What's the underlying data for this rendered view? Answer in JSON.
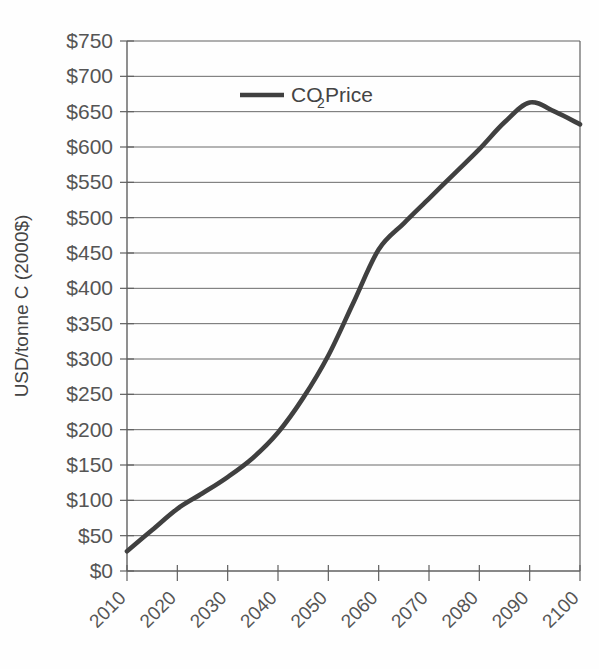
{
  "chart_data": {
    "type": "line",
    "title": "",
    "xlabel": "",
    "ylabel": "USD/tonne C (2000$)",
    "xlim": [
      2010,
      2100
    ],
    "ylim": [
      0,
      750
    ],
    "grid": true,
    "grid_axis": "y",
    "legend_position": "top-center",
    "line_color": "#404040",
    "series": [
      {
        "name": "CO2 Price",
        "label_main": "CO",
        "label_sub": "2",
        "label_tail": " Price",
        "x": [
          2010,
          2015,
          2020,
          2025,
          2030,
          2035,
          2040,
          2045,
          2050,
          2055,
          2060,
          2065,
          2070,
          2075,
          2080,
          2085,
          2090,
          2095,
          2100
        ],
        "values": [
          28,
          58,
          88,
          110,
          133,
          160,
          196,
          245,
          305,
          380,
          455,
          492,
          527,
          562,
          597,
          635,
          663,
          650,
          632
        ]
      }
    ],
    "x_ticks": [
      2010,
      2020,
      2030,
      2040,
      2050,
      2060,
      2070,
      2080,
      2090,
      2100
    ],
    "x_tick_labels": [
      "2010",
      "2020",
      "2030",
      "2040",
      "2050",
      "2060",
      "2070",
      "2080",
      "2090",
      "2100"
    ],
    "y_ticks": [
      0,
      50,
      100,
      150,
      200,
      250,
      300,
      350,
      400,
      450,
      500,
      550,
      600,
      650,
      700,
      750
    ],
    "y_tick_labels": [
      "$0",
      "$50",
      "$100",
      "$150",
      "$200",
      "$250",
      "$300",
      "$350",
      "$400",
      "$450",
      "$500",
      "$550",
      "$600",
      "$650",
      "$700",
      "$750"
    ]
  },
  "legend": {
    "entry_main": "CO",
    "entry_sub": "2",
    "entry_tail": " Price"
  },
  "axes": {
    "y_title": "USD/tonne C (2000$)"
  }
}
